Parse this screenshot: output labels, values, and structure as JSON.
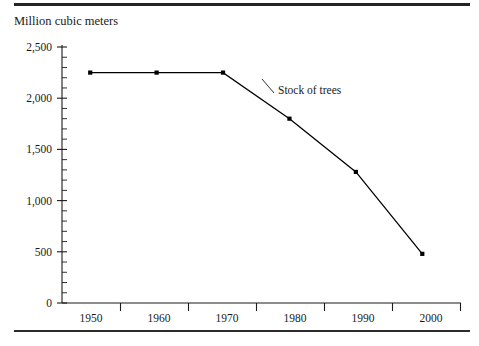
{
  "figure": {
    "background_color": "#ffffff",
    "ink_color": "#1a1a1a",
    "axis_title": "Million cubic meters",
    "rules": {
      "top_visible": true,
      "bottom_visible": true
    }
  },
  "chart_data": {
    "type": "line",
    "title": "",
    "subtitle": "",
    "xlabel": "",
    "ylabel": "Million cubic meters",
    "x": [
      1950,
      1960,
      1970,
      1980,
      1990,
      2000
    ],
    "categories": [
      "1950",
      "1960",
      "1970",
      "1980",
      "1990",
      "2000"
    ],
    "series": [
      {
        "name": "Stock of trees",
        "values": [
          2250,
          2250,
          2250,
          1800,
          1280,
          480
        ],
        "color": "#000000",
        "marker": "square",
        "annotation": "Stock of trees"
      }
    ],
    "ylim": [
      0,
      2500
    ],
    "yticks": [
      0,
      500,
      1000,
      1500,
      2000,
      2500
    ],
    "ytick_labels": [
      "0",
      "500",
      "1,000",
      "1,500",
      "2,000",
      "2,500"
    ],
    "y_minor_tick_step": 100,
    "xtick_labels": [
      "1950",
      "1960",
      "1970",
      "1980",
      "1990",
      "2000"
    ],
    "grid": false,
    "legend": "inline-annotation",
    "legend_position": "inside-plot-area"
  }
}
